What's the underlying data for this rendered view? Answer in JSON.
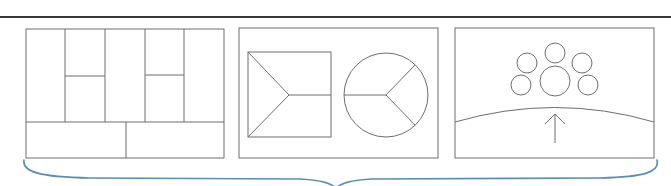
{
  "colors": {
    "background": "#ffffff",
    "rule": "#3a3a3a",
    "line": "#6e6e6e",
    "brace": "#5b8db3"
  },
  "diagram": {
    "top_rule": {
      "x1": 0,
      "x2": 671,
      "y": 17,
      "width": 2.2
    },
    "panels": [
      {
        "id": "grid-layout",
        "box": {
          "x": 26,
          "y": 29,
          "w": 198,
          "h": 129
        },
        "description": "Grid of five vertical columns with two split columns over a two-cell bottom row"
      },
      {
        "id": "square-and-circle",
        "box": {
          "x": 239,
          "y": 28,
          "w": 199,
          "h": 130
        },
        "description": "Square divided by a Y shape and a circle divided into three sectors"
      },
      {
        "id": "cluster-and-horizon",
        "box": {
          "x": 455,
          "y": 28,
          "w": 199,
          "h": 130
        },
        "description": "Cluster of six circles above a curved horizon with an upward arrow"
      }
    ],
    "brace": {
      "x1": 24,
      "x2": 657,
      "y_top": 162,
      "y_mid": 179,
      "tip_x": 336,
      "tip_y": 188
    }
  }
}
